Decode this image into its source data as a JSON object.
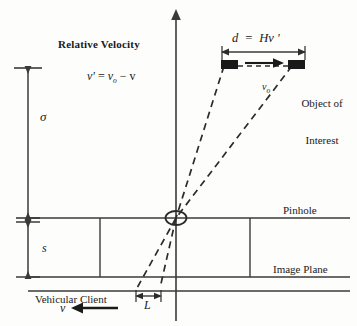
{
  "diagram": {
    "type": "technical-line-diagram",
    "background_color": "#fdfdfc",
    "line_color": "#2b2b2b",
    "object_fill_color": "#1a1a1a",
    "labels": {
      "relative_velocity_heading": "Relative Velocity",
      "relative_velocity_formula_lhs": "v",
      "relative_velocity_prime": "'",
      "relative_velocity_eq": "=",
      "relative_velocity_rhs_v0": "v",
      "relative_velocity_rhs_sub": "o",
      "relative_velocity_minus": "−",
      "relative_velocity_rhs_v": "v",
      "distance_formula": "d  =  Hv '",
      "object_velocity": "v",
      "object_velocity_sub": "o",
      "object_of_interest_line1": "Object of",
      "object_of_interest_line2": "Interest",
      "sigma": "σ",
      "s": "s",
      "pinhole": "Pinhole",
      "image_plane": "Image Plane",
      "vehicular_client": "Vehicular Client",
      "vehicle_velocity": "v",
      "baseline_L": "L"
    },
    "geometry": {
      "optical_axis_x": 176,
      "pinhole_point": {
        "x": 176,
        "y": 218
      },
      "pinhole_line_y": 218,
      "image_plane_y": 277,
      "ground_line_y": 291,
      "sigma_span": {
        "top": 68,
        "bottom": 218
      },
      "s_span": {
        "top": 218,
        "bottom": 277
      },
      "object_near": {
        "x": 221,
        "y": 60,
        "width": 17,
        "height": 9
      },
      "object_far": {
        "x": 288,
        "y": 60,
        "width": 17,
        "height": 9
      },
      "dimension_d_span": {
        "x1": 222,
        "x2": 305,
        "y": 52
      },
      "dimension_L_span": {
        "x1": 136,
        "x2": 160,
        "y": 296
      }
    }
  }
}
